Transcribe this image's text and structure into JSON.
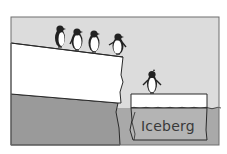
{
  "illustration": {
    "subject": "penguins on ice shelf above water with a small iceberg",
    "iceberg_label": "Iceberg",
    "penguin_count_on_shelf": 4,
    "penguin_count_on_iceberg": 1,
    "colors": {
      "sky": "#dcdcdc",
      "water": "#a9a9a9",
      "ice": "#ffffff",
      "outline": "#2a2a2a",
      "frame": "#6e6e6e"
    }
  }
}
